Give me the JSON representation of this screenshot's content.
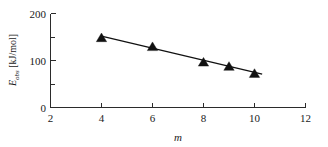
{
  "chart_data": {
    "type": "scatter",
    "title": "",
    "subtitle": "",
    "xlabel": "m",
    "ylabel": "E_obs [kJ/mol]",
    "ylabel_symbol": "E",
    "ylabel_subscript": "obs",
    "ylabel_units": "[kJ/mol]",
    "xlim": [
      2,
      12
    ],
    "ylim": [
      0,
      200
    ],
    "x_ticks": [
      2,
      4,
      6,
      8,
      10,
      12
    ],
    "x_tick_labels": [
      "2",
      "4",
      "6",
      "8",
      "10",
      "12"
    ],
    "y_ticks": [
      0,
      100,
      200
    ],
    "y_tick_labels": [
      "0",
      "100",
      "200"
    ],
    "y_minor_ticks": [
      50,
      150
    ],
    "grid": false,
    "legend": null,
    "marker_style": "filled-triangle",
    "marker_color": "#111111",
    "line_color": "#111111",
    "x": [
      4,
      6,
      8,
      9,
      10
    ],
    "values": [
      148,
      129,
      96,
      87,
      72
    ],
    "series": [
      {
        "name": "E_obs",
        "x": [
          4,
          6,
          8,
          9,
          10
        ],
        "values": [
          148,
          129,
          96,
          87,
          72
        ]
      }
    ],
    "trend_line": {
      "x_start": 4,
      "y_start": 152,
      "x_end": 10.3,
      "y_end": 71
    },
    "points": [
      {
        "x": 4,
        "y": 148
      },
      {
        "x": 6,
        "y": 129
      },
      {
        "x": 8,
        "y": 96
      },
      {
        "x": 9,
        "y": 87
      },
      {
        "x": 10,
        "y": 72
      }
    ]
  },
  "axis": {
    "x_title": "m",
    "y_symbol": "E",
    "y_subscript": "obs",
    "y_units": "[kJ/mol]"
  },
  "ticks": {
    "x": [
      "2",
      "4",
      "6",
      "8",
      "10",
      "12"
    ],
    "y": [
      "200",
      "100",
      "0"
    ]
  }
}
